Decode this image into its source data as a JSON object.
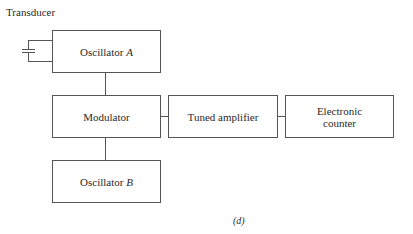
{
  "diagram": {
    "transducer_label": "Transducer",
    "blocks": {
      "oscillator_a": {
        "text": "Oscillator",
        "var": "A"
      },
      "modulator": {
        "text": "Modulator"
      },
      "tuned_amplifier": {
        "text": "Tuned amplifier"
      },
      "electronic_counter": {
        "line1": "Electronic",
        "line2": "counter"
      },
      "oscillator_b": {
        "text": "Oscillator",
        "var": "B"
      }
    },
    "caption": "(d)",
    "line_color": "#555555"
  }
}
